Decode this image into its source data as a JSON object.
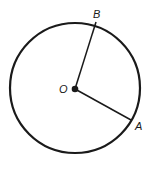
{
  "diagram": {
    "type": "circle-with-radii",
    "circle": {
      "cx": 75,
      "cy": 88,
      "r": 65,
      "stroke": "#1a1a1a",
      "stroke_width": 2.2
    },
    "center": {
      "label": "O",
      "x": 75,
      "y": 89,
      "label_x": 59,
      "label_y": 93
    },
    "points": [
      {
        "label": "B",
        "x": 96,
        "y": 22,
        "label_x": 93,
        "label_y": 18
      },
      {
        "label": "A",
        "x": 131,
        "y": 120,
        "label_x": 135,
        "label_y": 130
      }
    ],
    "segments": [
      {
        "from": "O",
        "to": "B"
      },
      {
        "from": "O",
        "to": "A"
      }
    ],
    "line_color": "#1a1a1a"
  }
}
